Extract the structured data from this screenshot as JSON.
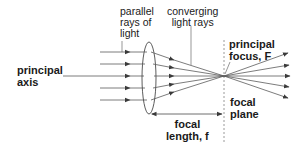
{
  "diagram": {
    "labels": {
      "parallel_rays": "parallel\nrays of\nlight",
      "converging_rays": "converging\nlight rays",
      "principal_axis": "principal\naxis",
      "principal_focus": "principal\nfocus, F",
      "focal_plane": "focal\nplane",
      "focal_length": "focal\nlength, f"
    },
    "colors": {
      "line": "#4a4a4a",
      "text": "#1a1a1a",
      "dashed": "#9a9a9a"
    },
    "geometry": {
      "lens_center": [
        149,
        76
      ],
      "focal_point": [
        224,
        76
      ],
      "incoming_ray_y": [
        52,
        64,
        76,
        88,
        100
      ],
      "focal_plane_x": 224,
      "focal_length_arrow_y": 114
    }
  }
}
